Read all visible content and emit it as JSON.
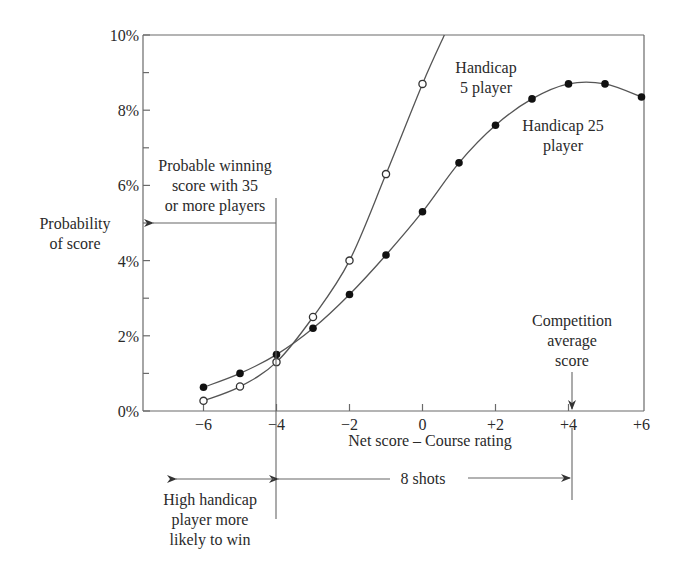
{
  "chart_data": {
    "type": "line",
    "title": "",
    "xlabel": "Net score – Course rating",
    "ylabel": "Probability of score",
    "xlim": [
      -7.6,
      6
    ],
    "ylim": [
      0,
      10
    ],
    "x_ticks": [
      "−6",
      "−4",
      "−2",
      "0",
      "+2",
      "+4",
      "+6"
    ],
    "x_tick_values": [
      -6,
      -4,
      -2,
      0,
      2,
      4,
      6
    ],
    "y_ticks": [
      "0%",
      "2%",
      "4%",
      "6%",
      "8%",
      "10%"
    ],
    "y_tick_values": [
      0,
      2,
      4,
      6,
      8,
      10
    ],
    "y_minor_ticks": [
      1,
      3,
      5,
      7,
      9
    ],
    "grid": false,
    "series": [
      {
        "name": "Handicap 5 player",
        "marker": "open-circle",
        "x": [
          -6,
          -5,
          -4,
          -3,
          -2,
          -1,
          0
        ],
        "values": [
          0.27,
          0.65,
          1.3,
          2.5,
          4.0,
          6.3,
          8.7
        ],
        "extends_to": {
          "x": 0.6,
          "y": 10
        }
      },
      {
        "name": "Handicap 25 player",
        "marker": "filled-circle",
        "x": [
          -6,
          -5,
          -4,
          -3,
          -2,
          -1,
          0,
          1,
          2,
          3,
          4,
          5,
          6
        ],
        "values": [
          0.63,
          1.0,
          1.5,
          2.2,
          3.1,
          4.15,
          5.3,
          6.6,
          7.6,
          8.3,
          8.7,
          8.7,
          8.35
        ]
      }
    ],
    "annotations": [
      {
        "text": "Handicap 5 player",
        "lines": [
          "Handicap",
          "5 player"
        ]
      },
      {
        "text": "Handicap 25 player",
        "lines": [
          "Handicap 25",
          "player"
        ]
      },
      {
        "text": "Probable winning score with 35 or more players",
        "lines": [
          "Probable winning",
          "score with 35",
          "or more players"
        ],
        "x": -4
      },
      {
        "text": "Probability of score",
        "lines": [
          "Probability",
          "of score"
        ]
      },
      {
        "text": "Competition average score",
        "lines": [
          "Competition",
          "average",
          "score"
        ],
        "x": 4
      },
      {
        "text": "8 shots",
        "from_x": -4,
        "to_x": 4
      },
      {
        "text": "High handicap player more likely to win",
        "lines": [
          "High handicap",
          "player more",
          "likely to win"
        ]
      }
    ]
  },
  "labels": {
    "y_axis_line1": "Probability",
    "y_axis_line2": "of score",
    "x_axis": "Net score – Course rating",
    "h5_line1": "Handicap",
    "h5_line2": "5 player",
    "h25_line1": "Handicap 25",
    "h25_line2": "player",
    "win_line1": "Probable winning",
    "win_line2": "score with 35",
    "win_line3": "or more players",
    "comp_line1": "Competition",
    "comp_line2": "average",
    "comp_line3": "score",
    "shots": "8 shots",
    "high_line1": "High handicap",
    "high_line2": "player more",
    "high_line3": "likely to win"
  },
  "ticks": {
    "y": [
      "0%",
      "2%",
      "4%",
      "6%",
      "8%",
      "10%"
    ],
    "x": [
      "−6",
      "−4",
      "−2",
      "0",
      "+2",
      "+4",
      "+6"
    ]
  }
}
